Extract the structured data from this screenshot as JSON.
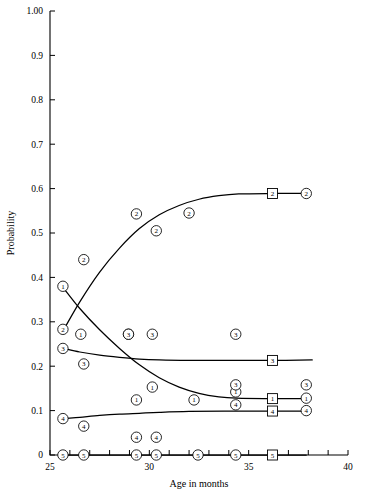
{
  "chart_data": {
    "type": "scatter",
    "title": "",
    "xlabel": "Age in months",
    "ylabel": "Probability",
    "xlim": [
      25,
      40
    ],
    "ylim": [
      0,
      1.0
    ],
    "grid": false,
    "legend_position": "none",
    "xticks": [
      25,
      26,
      27,
      28,
      29,
      30,
      31,
      32,
      33,
      34,
      35,
      36,
      37,
      38,
      39,
      40
    ],
    "xtick_labels": [
      {
        "value": 25,
        "label": "25"
      },
      {
        "value": 30,
        "label": "30"
      },
      {
        "value": 35,
        "label": "35"
      },
      {
        "value": 40,
        "label": "40"
      }
    ],
    "yticks": [
      0,
      0.1,
      0.2,
      0.3,
      0.4,
      0.5,
      0.6,
      0.7,
      0.8,
      0.9,
      1.0
    ],
    "ytick_labels": [
      {
        "value": 1.0,
        "label": "1.00"
      },
      {
        "value": 0.9,
        "label": "0.9"
      },
      {
        "value": 0.8,
        "label": "0.8"
      },
      {
        "value": 0.7,
        "label": "0.7"
      },
      {
        "value": 0.6,
        "label": "0.6"
      },
      {
        "value": 0.5,
        "label": "0.5"
      },
      {
        "value": 0.4,
        "label": "0.4"
      },
      {
        "value": 0.3,
        "label": "0.3"
      },
      {
        "value": 0.2,
        "label": "0.2"
      },
      {
        "value": 0.1,
        "label": "0.1"
      },
      {
        "value": 0.0,
        "label": "0"
      }
    ],
    "series": [
      {
        "name": "1",
        "marker_label": "1",
        "marker_shape": "circle",
        "fit_marker_shape": "square",
        "points": [
          {
            "x": 25.65,
            "y": 0.38
          },
          {
            "x": 26.55,
            "y": 0.272
          },
          {
            "x": 28.95,
            "y": 0.272
          },
          {
            "x": 30.15,
            "y": 0.153
          },
          {
            "x": 29.35,
            "y": 0.124
          },
          {
            "x": 32.25,
            "y": 0.124
          },
          {
            "x": 34.35,
            "y": 0.142
          },
          {
            "x": 37.9,
            "y": 0.128
          }
        ],
        "fit_curve": [
          {
            "x": 25.7,
            "y": 0.375
          },
          {
            "x": 26.5,
            "y": 0.33
          },
          {
            "x": 27.5,
            "y": 0.282
          },
          {
            "x": 28.5,
            "y": 0.24
          },
          {
            "x": 29.5,
            "y": 0.203
          },
          {
            "x": 30.5,
            "y": 0.174
          },
          {
            "x": 31.5,
            "y": 0.153
          },
          {
            "x": 32.5,
            "y": 0.139
          },
          {
            "x": 33.5,
            "y": 0.131
          },
          {
            "x": 34.4,
            "y": 0.128
          },
          {
            "x": 36.2,
            "y": 0.127
          },
          {
            "x": 37.9,
            "y": 0.127
          }
        ],
        "fit_marker": {
          "x": 36.2,
          "y": 0.127
        }
      },
      {
        "name": "2",
        "marker_label": "2",
        "marker_shape": "circle",
        "fit_marker_shape": "square",
        "points": [
          {
            "x": 25.65,
            "y": 0.283
          },
          {
            "x": 26.7,
            "y": 0.44
          },
          {
            "x": 29.35,
            "y": 0.543
          },
          {
            "x": 30.35,
            "y": 0.505
          },
          {
            "x": 32.0,
            "y": 0.545
          },
          {
            "x": 37.9,
            "y": 0.589
          }
        ],
        "fit_curve": [
          {
            "x": 25.7,
            "y": 0.283
          },
          {
            "x": 26.5,
            "y": 0.345
          },
          {
            "x": 27.5,
            "y": 0.412
          },
          {
            "x": 28.5,
            "y": 0.466
          },
          {
            "x": 29.5,
            "y": 0.51
          },
          {
            "x": 30.5,
            "y": 0.541
          },
          {
            "x": 31.5,
            "y": 0.562
          },
          {
            "x": 32.5,
            "y": 0.576
          },
          {
            "x": 33.5,
            "y": 0.584
          },
          {
            "x": 34.5,
            "y": 0.588
          },
          {
            "x": 36.2,
            "y": 0.589
          },
          {
            "x": 37.9,
            "y": 0.589
          }
        ],
        "fit_marker": {
          "x": 36.2,
          "y": 0.589
        }
      },
      {
        "name": "3",
        "marker_label": "3",
        "marker_shape": "circle",
        "fit_marker_shape": "square",
        "points": [
          {
            "x": 25.65,
            "y": 0.24
          },
          {
            "x": 26.7,
            "y": 0.205
          },
          {
            "x": 28.95,
            "y": 0.272
          },
          {
            "x": 30.15,
            "y": 0.272
          },
          {
            "x": 34.35,
            "y": 0.272
          },
          {
            "x": 34.35,
            "y": 0.158
          },
          {
            "x": 37.9,
            "y": 0.158
          }
        ],
        "fit_curve": [
          {
            "x": 25.7,
            "y": 0.24
          },
          {
            "x": 26.5,
            "y": 0.232
          },
          {
            "x": 27.5,
            "y": 0.225
          },
          {
            "x": 28.5,
            "y": 0.22
          },
          {
            "x": 29.5,
            "y": 0.216
          },
          {
            "x": 30.5,
            "y": 0.214
          },
          {
            "x": 32.0,
            "y": 0.213
          },
          {
            "x": 34.0,
            "y": 0.213
          },
          {
            "x": 36.2,
            "y": 0.213
          },
          {
            "x": 38.2,
            "y": 0.214
          }
        ],
        "fit_marker": {
          "x": 36.2,
          "y": 0.213
        }
      },
      {
        "name": "4",
        "marker_label": "4",
        "marker_shape": "circle",
        "fit_marker_shape": "square",
        "points": [
          {
            "x": 25.65,
            "y": 0.082
          },
          {
            "x": 26.7,
            "y": 0.065
          },
          {
            "x": 29.35,
            "y": 0.04
          },
          {
            "x": 30.35,
            "y": 0.04
          },
          {
            "x": 34.35,
            "y": 0.113
          },
          {
            "x": 37.9,
            "y": 0.1
          }
        ],
        "fit_curve": [
          {
            "x": 25.7,
            "y": 0.082
          },
          {
            "x": 26.5,
            "y": 0.085
          },
          {
            "x": 27.5,
            "y": 0.089
          },
          {
            "x": 28.5,
            "y": 0.092
          },
          {
            "x": 29.5,
            "y": 0.094
          },
          {
            "x": 30.5,
            "y": 0.096
          },
          {
            "x": 32.0,
            "y": 0.098
          },
          {
            "x": 34.0,
            "y": 0.099
          },
          {
            "x": 36.2,
            "y": 0.099
          },
          {
            "x": 37.9,
            "y": 0.099
          }
        ],
        "fit_marker": {
          "x": 36.2,
          "y": 0.099
        }
      },
      {
        "name": "5",
        "marker_label": "5",
        "marker_shape": "circle",
        "fit_marker_shape": "square",
        "points": [
          {
            "x": 25.65,
            "y": 0.0
          },
          {
            "x": 26.7,
            "y": 0.0
          },
          {
            "x": 29.35,
            "y": 0.0
          },
          {
            "x": 30.35,
            "y": 0.0
          },
          {
            "x": 32.45,
            "y": 0.0
          },
          {
            "x": 34.35,
            "y": 0.0
          }
        ],
        "fit_curve": [
          {
            "x": 25.7,
            "y": 0.0
          },
          {
            "x": 37.9,
            "y": 0.0
          }
        ],
        "fit_marker": {
          "x": 36.2,
          "y": 0.0
        }
      }
    ]
  }
}
